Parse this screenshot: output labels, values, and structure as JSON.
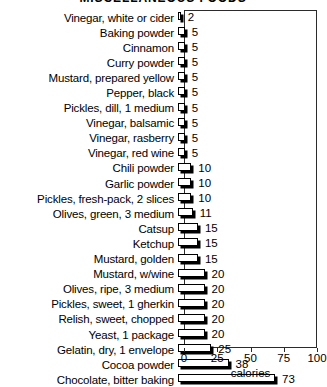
{
  "chart_data": {
    "type": "bar",
    "orientation": "horizontal",
    "title": "MISCELLANEOUS FOODS",
    "xlabel": "calories",
    "ylabel": "",
    "xlim": [
      0,
      100
    ],
    "xticks": [
      0,
      25,
      50,
      75,
      100
    ],
    "grid": false,
    "legend": null,
    "categories": [
      "Vinegar, white or cider",
      "Baking powder",
      "Cinnamon",
      "Curry powder",
      "Mustard, prepared yellow",
      "Pepper, black",
      "Pickles, dill, 1 medium",
      "Vinegar, balsamic",
      "Vinegar, rasberry",
      "Vinegar, red wine",
      "Chili powder",
      "Garlic powder",
      "Pickles, fresh-pack, 2 slices",
      "Olives, green, 3 medium",
      "Catsup",
      "Ketchup",
      "Mustard, golden",
      "Mustard, w/wine",
      "Olives, ripe, 3 medium",
      "Pickles, sweet, 1 gherkin",
      "Relish, sweet, chopped",
      "Yeast, 1 package",
      "Gelatin, dry, 1 envelope",
      "Cocoa powder",
      "Chocolate, bitter baking"
    ],
    "values": [
      2,
      5,
      5,
      5,
      5,
      5,
      5,
      5,
      5,
      5,
      10,
      10,
      10,
      11,
      15,
      15,
      15,
      20,
      20,
      20,
      20,
      20,
      25,
      38,
      73
    ],
    "value_labels": [
      "2",
      "5",
      "5",
      "5",
      "5",
      "5",
      "5",
      "5",
      "5",
      "5",
      "10",
      "10",
      "10",
      "11",
      "15",
      "15",
      "15",
      "20",
      "20",
      "20",
      "20",
      "20",
      "25",
      "38",
      "73"
    ]
  },
  "colors": {
    "bar_face": "#ffffff",
    "bar_outline": "#000000",
    "bar_shadow": "#000000",
    "axis": "#2b2b2b",
    "text": "#000000",
    "background": "#ffffff"
  }
}
